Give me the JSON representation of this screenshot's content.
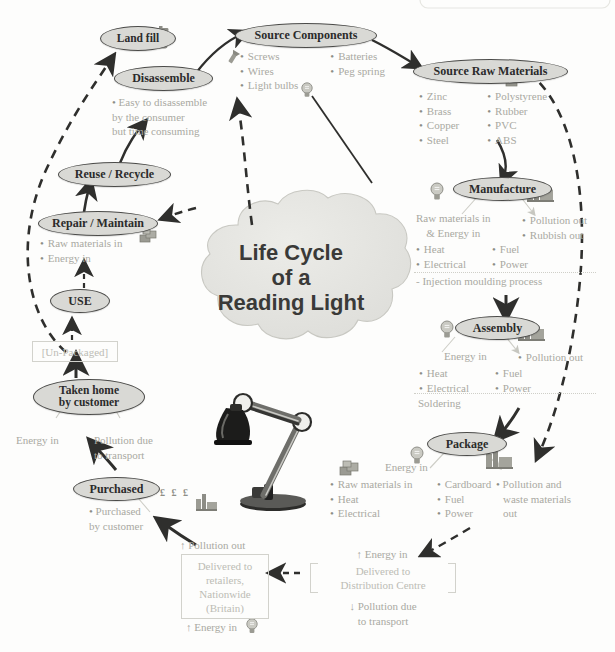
{
  "title": "Life Cycle of a Reading Light",
  "center": {
    "line1": "Life Cycle",
    "line2": "of a",
    "line3": "Reading Light"
  },
  "nodes": {
    "land_fill": "Land fill",
    "disassemble": "Disassemble",
    "reuse_recycle": "Reuse / Recycle",
    "repair_maintain": "Repair / Maintain",
    "use": "USE",
    "taken_home": "Taken home\nby customer",
    "taken_home_l1": "Taken home",
    "taken_home_l2": "by customer",
    "purchased": "Purchased",
    "source_components": "Source Components",
    "source_raw_materials": "Source Raw Materials",
    "manufacture": "Manufacture",
    "assembly": "Assembly",
    "package": "Package"
  },
  "disassemble_note": "Easy to disassemble\nby the consumer\nbut time consuming",
  "disassemble_note_l1": "Easy to disassemble",
  "disassemble_note_l2": "by the consumer",
  "disassemble_note_l3": "but time consuming",
  "source_components_items": {
    "col1": [
      "Screws",
      "Wires",
      "Light bulbs"
    ],
    "col2": [
      "Batteries",
      "Peg spring"
    ]
  },
  "source_raw_materials_items": {
    "col1": [
      "Zinc",
      "Brass",
      "Copper",
      "Steel"
    ],
    "col2": [
      "Polystyrene",
      "Rubber",
      "PVC",
      "ABS"
    ]
  },
  "repair_items": [
    "Raw materials in",
    "Energy in"
  ],
  "purchased_items_l1": "Purchased",
  "purchased_items_l2": "by customer",
  "purchased_currency": "£ £ £",
  "taken_home_energy": "Energy in",
  "taken_home_pollution_l1": "Pollution due",
  "taken_home_pollution_l2": "to transport",
  "un_packaged": "[Un-Packaged]",
  "manufacture": {
    "inputs_l1": "Raw materials in",
    "inputs_l2": "& Energy in",
    "in_col1": [
      "Heat",
      "Electrical"
    ],
    "in_col2": [
      "Fuel",
      "Power"
    ],
    "out": [
      "Pollution out",
      "Rubbish out"
    ],
    "process": "- Injection moulding process"
  },
  "assembly": {
    "inputs": "Energy in",
    "in_col1": [
      "Heat",
      "Electrical"
    ],
    "in_col2": [
      "Fuel",
      "Power"
    ],
    "out": [
      "Pollution out"
    ],
    "process": "Soldering"
  },
  "package": {
    "inputs": "Energy in",
    "in_col1": [
      "Raw materials in",
      "Heat",
      "Electrical"
    ],
    "in_col2": [
      "Cardboard",
      "Fuel",
      "Power"
    ],
    "out_l1": "Pollution and",
    "out_l2": "waste materials",
    "out_l3": "out"
  },
  "distribution": {
    "energy_in": "↑ Energy in",
    "box_l1": "Delivered to",
    "box_l2": "Distribution Centre",
    "pollution_l1": "↓ Pollution due",
    "pollution_l2": "to transport"
  },
  "retail": {
    "pollution_out": "↑ Pollution out",
    "box_l1": "Delivered to",
    "box_l2": "retailers,",
    "box_l3": "Nationwide",
    "box_l4": "(Britain)",
    "energy_in": "↑ Energy in"
  },
  "colors": {
    "oval_fill": "#d9d9d5",
    "oval_stroke": "#4b4b49",
    "faint_text": "#a9a9a2",
    "dark_text": "#2b2b2b",
    "cloud_fill": "#e3e3df",
    "arrow_solid": "#2f2f2d",
    "arrow_faint": "#c9c9c2"
  }
}
